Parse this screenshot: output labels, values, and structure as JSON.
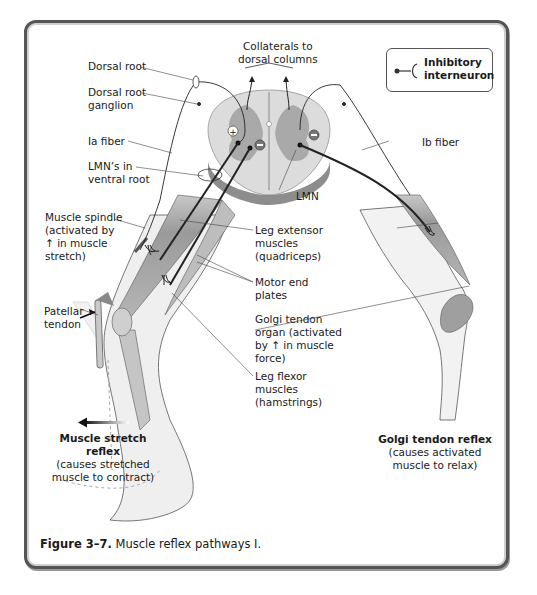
{
  "figure": {
    "number": "Figure 3–7.",
    "caption": "Muscle reflex pathways I."
  },
  "legend": {
    "icon": "inhibitory-interneuron-symbol",
    "line1": "Inhibitory",
    "line2": "interneuron"
  },
  "labels": {
    "collaterals": "Collaterals to\ndorsal columns",
    "dorsal_root": "Dorsal root",
    "dorsal_root_ganglion": "Dorsal root\nganglion",
    "ia_fiber": "Ia fiber",
    "lmn_ventral_root": "LMN’s in\nventral root",
    "lmn": "LMN",
    "ib_fiber": "Ib fiber",
    "muscle_spindle": "Muscle spindle\n(activated by\n↑ in muscle\nstretch)",
    "leg_extensor": "Leg extensor\nmuscles\n(quadriceps)",
    "motor_end_plates": "Motor end\nplates",
    "golgi_tendon_organ": "Golgi tendon\norgan (activated\nby ↑ in muscle\nforce)",
    "leg_flexor": "Leg flexor\nmuscles\n(hamstrings)",
    "patellar_tendon": "Patellar\ntendon"
  },
  "reflexes": {
    "stretch_title": "Muscle stretch\nreflex",
    "stretch_desc": "(causes stretched\nmuscle to contract)",
    "golgi_title": "Golgi tendon reflex",
    "golgi_desc": "(causes activated\nmuscle to relax)"
  },
  "symbols": {
    "excitatory": "+",
    "inhibitory": "−"
  },
  "colors": {
    "frame": "#555555",
    "cord_white_matter": "#d9d9d9",
    "cord_gray_matter": "#a6a6a6",
    "muscle": "#9a9a9a",
    "skin": "#efefef",
    "line": "#333333"
  }
}
